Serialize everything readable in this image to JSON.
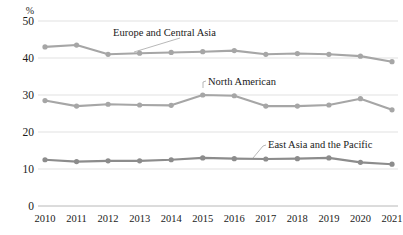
{
  "chart_data": {
    "type": "line",
    "title": "",
    "xlabel": "",
    "ylabel": "%",
    "ylim": [
      0,
      50
    ],
    "yticks": [
      0,
      10,
      20,
      30,
      40,
      50
    ],
    "grid": true,
    "legend_position": "inline-annotations",
    "categories": [
      "2010",
      "2011",
      "2012",
      "2013",
      "2014",
      "2015",
      "2016",
      "2017",
      "2018",
      "2019",
      "2020",
      "2021"
    ],
    "series": [
      {
        "name": "Europe and Central Asia",
        "color": "#a6a6a6",
        "values": [
          43.0,
          43.5,
          41.0,
          41.3,
          41.5,
          41.7,
          42.0,
          41.0,
          41.2,
          41.0,
          40.5,
          39.0
        ]
      },
      {
        "name": "North American",
        "color": "#a6a6a6",
        "values": [
          28.5,
          27.0,
          27.5,
          27.3,
          27.2,
          30.0,
          29.8,
          27.0,
          27.0,
          27.3,
          29.0,
          26.0
        ]
      },
      {
        "name": "East Asia and the Pacific",
        "color": "#8c8c8c",
        "values": [
          12.5,
          12.0,
          12.2,
          12.2,
          12.5,
          13.0,
          12.8,
          12.7,
          12.8,
          13.0,
          11.8,
          11.3
        ]
      }
    ],
    "annotations": [
      {
        "text": "Europe and Central Asia",
        "anchor_x": 113,
        "anchor_y": 36
      },
      {
        "text": "North American",
        "anchor_x": 208,
        "anchor_y": 85
      },
      {
        "text": "East Asia and the Pacific",
        "anchor_x": 268,
        "anchor_y": 148
      }
    ]
  },
  "axis": {
    "unit_label": "%",
    "y_tick_labels": [
      "50",
      "40",
      "30",
      "20",
      "10",
      "0"
    ],
    "x_tick_labels": [
      "2010",
      "2011",
      "2012",
      "2013",
      "2014",
      "2015",
      "2016",
      "2017",
      "2018",
      "2019",
      "2020",
      "2021"
    ]
  },
  "colors": {
    "series_light": "#a6a6a6",
    "series_dark": "#8c8c8c",
    "gridline": "#d9d9d9",
    "axis": "#b0b0b0",
    "text": "#1a1a1a"
  }
}
